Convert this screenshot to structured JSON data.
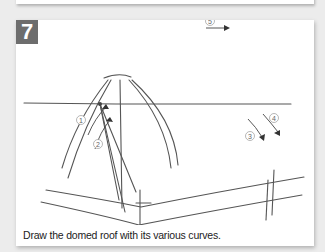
{
  "step": {
    "number": "7",
    "caption": "Draw the domed roof with its various curves."
  },
  "annotations": [
    "1",
    "2",
    "3",
    "4",
    "5"
  ],
  "colors": {
    "badge": "#6d6d6d",
    "panel": "#ffffff",
    "background": "#ececec",
    "pencil": "#555555"
  }
}
